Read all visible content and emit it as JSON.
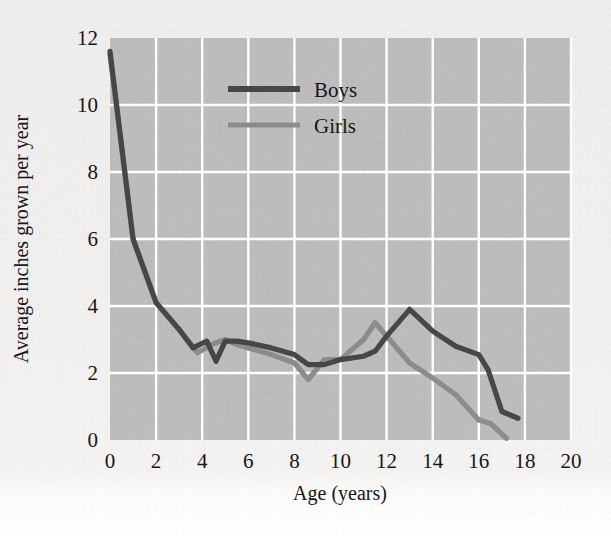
{
  "chart_data": {
    "type": "line",
    "title": "",
    "subtitle": "",
    "xlabel": "Age (years)",
    "ylabel": "Average inches grown per year",
    "xlim": [
      0,
      20
    ],
    "ylim": [
      0,
      12
    ],
    "xticks": [
      "0",
      "2",
      "4",
      "6",
      "8",
      "10",
      "12",
      "14",
      "16",
      "18",
      "20"
    ],
    "yticks": [
      "0",
      "2",
      "4",
      "6",
      "8",
      "10",
      "12"
    ],
    "grid": true,
    "grid_color": "#ffffff",
    "plot_bg": "#bcbcbc",
    "legend_position": "top-center",
    "series": [
      {
        "name": "Boys",
        "color": "#474747",
        "x": [
          0,
          1,
          2,
          3,
          3.6,
          4.2,
          4.6,
          5,
          5.5,
          6,
          7,
          8,
          8.6,
          9.3,
          10,
          11,
          11.5,
          12,
          13,
          14,
          15,
          16,
          16.4,
          17,
          17.7
        ],
        "y": [
          11.6,
          6.0,
          4.1,
          3.3,
          2.75,
          2.95,
          2.35,
          2.95,
          2.95,
          2.9,
          2.75,
          2.55,
          2.25,
          2.25,
          2.4,
          2.5,
          2.65,
          3.1,
          3.9,
          3.25,
          2.8,
          2.55,
          2.1,
          0.85,
          0.65
        ]
      },
      {
        "name": "Girls",
        "color": "#8c8c8c",
        "x": [
          0,
          1,
          2,
          3,
          3.8,
          4.4,
          5,
          5.5,
          6,
          7,
          8,
          8.6,
          9.3,
          10,
          11,
          11.5,
          12,
          13,
          14,
          15,
          16,
          16.5,
          17.2
        ],
        "y": [
          11.5,
          6.0,
          4.1,
          3.3,
          2.6,
          2.85,
          3.0,
          2.85,
          2.75,
          2.55,
          2.3,
          1.8,
          2.4,
          2.4,
          3.0,
          3.5,
          3.1,
          2.3,
          1.85,
          1.35,
          0.6,
          0.5,
          0.05
        ]
      }
    ]
  },
  "legend": {
    "items": [
      {
        "label": "Boys",
        "color": "#474747"
      },
      {
        "label": "Girls",
        "color": "#8c8c8c"
      }
    ]
  },
  "axes": {
    "x_title": "Age (years)",
    "y_title": "Average inches grown per year"
  }
}
